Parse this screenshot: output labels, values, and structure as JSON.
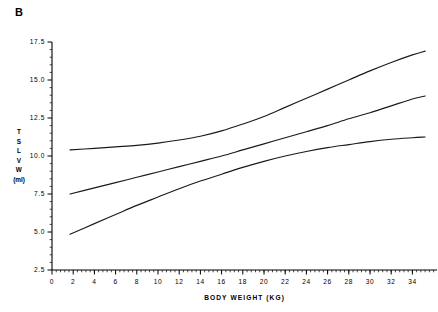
{
  "figure": {
    "panel_label": "B",
    "background_color": "#ffffff",
    "line_color": "#1a1a1a",
    "axis_color": "#000000"
  },
  "axis_labels": {
    "x_title": "BODY WEIGHT  (KG)",
    "y_title_letters": [
      "T",
      "S",
      "L",
      "V",
      "W"
    ],
    "y_title_unit": "(ml)"
  },
  "chart_data": {
    "type": "line",
    "title": "B",
    "xlabel": "BODY WEIGHT  (KG)",
    "ylabel": "TSLVW (ml)",
    "xlim": [
      0,
      36
    ],
    "ylim": [
      2.5,
      17.5
    ],
    "xticks": [
      0,
      2,
      4,
      6,
      8,
      10,
      12,
      14,
      16,
      18,
      20,
      22,
      24,
      26,
      28,
      30,
      32,
      34
    ],
    "yticks": [
      2.5,
      5.0,
      7.5,
      10.0,
      12.5,
      15.0,
      17.5
    ],
    "xtick_labels": [
      "0",
      "2",
      "4",
      "6",
      "8",
      "10",
      "12",
      "14",
      "16",
      "18",
      "20",
      "22",
      "24",
      "26",
      "28",
      "30",
      "32",
      "34"
    ],
    "ytick_labels": [
      "2.5",
      "5.0",
      "7.5",
      "10.0",
      "12.5",
      "15.0",
      "17.5"
    ],
    "minor_ticks": true,
    "grid": false,
    "legend": "none",
    "series": [
      {
        "name": "upper-curve",
        "x": [
          1.7,
          4,
          6,
          8,
          10,
          12,
          14,
          16,
          18,
          20,
          22,
          24,
          26,
          28,
          30,
          32,
          34,
          35.2
        ],
        "values": [
          10.4,
          10.5,
          10.6,
          10.7,
          10.85,
          11.05,
          11.3,
          11.65,
          12.1,
          12.6,
          13.2,
          13.8,
          14.4,
          15.0,
          15.6,
          16.15,
          16.65,
          16.9
        ]
      },
      {
        "name": "middle-curve",
        "x": [
          1.7,
          4,
          6,
          8,
          10,
          12,
          14,
          16,
          18,
          20,
          22,
          24,
          26,
          28,
          30,
          32,
          34,
          35.2
        ],
        "values": [
          7.5,
          7.9,
          8.25,
          8.6,
          8.95,
          9.3,
          9.65,
          10.0,
          10.4,
          10.8,
          11.2,
          11.6,
          12.0,
          12.45,
          12.85,
          13.3,
          13.75,
          13.95
        ]
      },
      {
        "name": "lower-curve",
        "x": [
          1.7,
          4,
          6,
          8,
          10,
          12,
          14,
          16,
          18,
          20,
          22,
          24,
          26,
          28,
          30,
          32,
          34,
          35.2
        ],
        "values": [
          4.85,
          5.55,
          6.15,
          6.75,
          7.3,
          7.85,
          8.35,
          8.8,
          9.25,
          9.65,
          10.0,
          10.3,
          10.55,
          10.75,
          10.95,
          11.1,
          11.2,
          11.25
        ]
      }
    ]
  }
}
